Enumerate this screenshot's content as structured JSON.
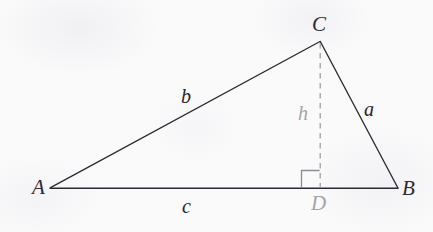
{
  "figure": {
    "kind": "geometry-diagram",
    "canvas": {
      "width": 433,
      "height": 232
    },
    "background_color": "#fbfafb",
    "stroke_color": "#2a2a33",
    "faint_stroke_color": "#9d9b9f",
    "vertices": [
      {
        "id": "A",
        "label": "A",
        "x": 50,
        "y": 188,
        "label_x": 32,
        "label_y": 177
      },
      {
        "id": "B",
        "label": "B",
        "x": 398,
        "y": 188,
        "label_x": 402,
        "label_y": 178
      },
      {
        "id": "C",
        "label": "C",
        "x": 320,
        "y": 41,
        "label_x": 312,
        "label_y": 14
      },
      {
        "id": "D",
        "label": "D",
        "x": 320,
        "y": 188,
        "label_x": 311,
        "label_y": 193
      }
    ],
    "edges": [
      {
        "id": "AC",
        "from": "A",
        "to": "C",
        "style": "solid",
        "side_label": "b"
      },
      {
        "id": "CB",
        "from": "C",
        "to": "B",
        "style": "solid",
        "side_label": "a"
      },
      {
        "id": "AB",
        "from": "A",
        "to": "B",
        "style": "solid",
        "side_label": "c"
      },
      {
        "id": "CD",
        "from": "C",
        "to": "D",
        "style": "dashed",
        "side_label": "h"
      }
    ],
    "side_labels": [
      {
        "id": "b",
        "label": "b",
        "x": 181,
        "y": 86,
        "tone": "dark"
      },
      {
        "id": "a",
        "label": "a",
        "x": 364,
        "y": 99,
        "tone": "dark"
      },
      {
        "id": "c",
        "label": "c",
        "x": 182,
        "y": 196,
        "tone": "dark"
      },
      {
        "id": "h",
        "label": "h",
        "x": 298,
        "y": 103,
        "tone": "faint"
      }
    ],
    "right_angle_mark": {
      "at_vertex": "D",
      "x": 301,
      "y": 170,
      "size": 18,
      "orientation": "left-of-altitude"
    }
  }
}
